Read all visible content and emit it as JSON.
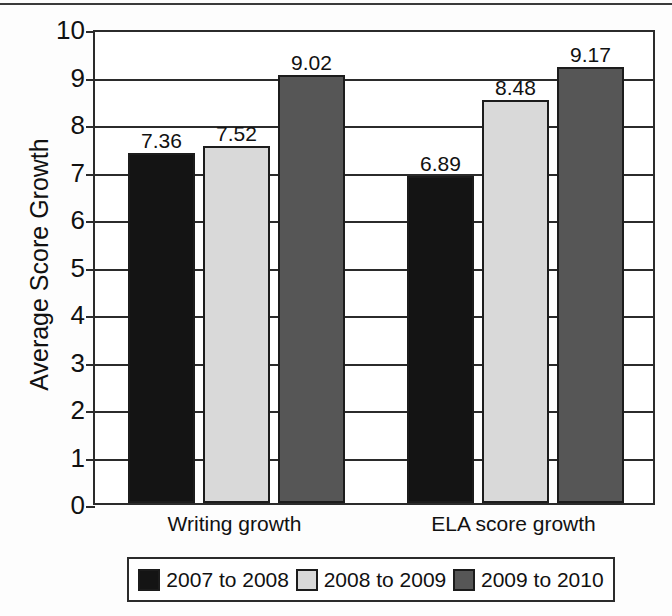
{
  "chart_data": {
    "type": "bar",
    "title": "",
    "xlabel": "",
    "ylabel": "Average Score Growth",
    "ylim": [
      0,
      10
    ],
    "ytick_labels": [
      "10",
      "9",
      "8",
      "7",
      "6",
      "5",
      "4",
      "3",
      "2",
      "1",
      "0"
    ],
    "ytick_values": [
      10,
      9,
      8,
      7,
      6,
      5,
      4,
      3,
      2,
      1,
      0
    ],
    "grid": true,
    "legend_position": "bottom",
    "categories": [
      "Writing growth",
      "ELA score growth"
    ],
    "series": [
      {
        "name": "2007 to 2008",
        "color": "#141414",
        "values": [
          7.36,
          6.89
        ],
        "labels": [
          "7.36",
          "6.89"
        ]
      },
      {
        "name": "2008 to 2009",
        "color": "#d9d9d9",
        "values": [
          7.52,
          8.48
        ],
        "labels": [
          "7.52",
          "8.48"
        ]
      },
      {
        "name": "2009 to 2010",
        "color": "#565656",
        "values": [
          9.02,
          9.17
        ],
        "labels": [
          "9.02",
          "9.17"
        ]
      }
    ]
  },
  "axis": {
    "y_title": "Average Score Growth"
  },
  "legend": {
    "items": [
      {
        "label": "2007 to 2008"
      },
      {
        "label": "2008 to 2009"
      },
      {
        "label": "2009 to 2010"
      }
    ]
  },
  "categories": [
    {
      "label": "Writing growth"
    },
    {
      "label": "ELA score growth"
    }
  ]
}
